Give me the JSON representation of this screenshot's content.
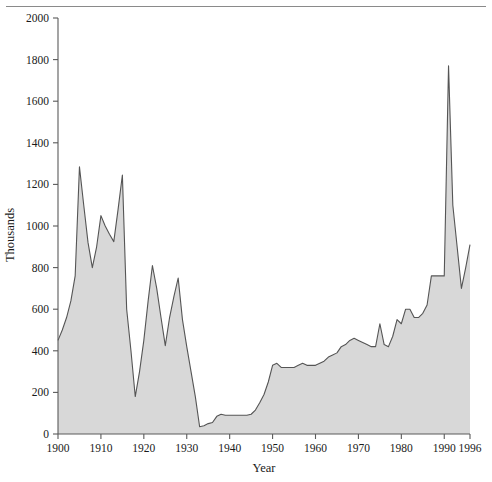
{
  "figure": {
    "background": "#ffffff",
    "has_top_rule": true
  },
  "chart_data": {
    "type": "area",
    "title": "",
    "subtitle": "",
    "xlabel": "Year",
    "ylabel": "Thousands",
    "xlim": [
      1900,
      1996
    ],
    "ylim": [
      0,
      2000
    ],
    "grid": false,
    "legend": null,
    "fill_color": "#d8d8d8",
    "line_color": "#555555",
    "axis_color": "#5a5a5a",
    "x_ticks": [
      1900,
      1910,
      1920,
      1930,
      1940,
      1950,
      1960,
      1970,
      1980,
      1990,
      1996
    ],
    "x_tick_labels": [
      "1900",
      "1910",
      "1920",
      "1930",
      "1940",
      "1950",
      "1960",
      "1970",
      "1980",
      "1990",
      "1996"
    ],
    "y_ticks": [
      0,
      200,
      400,
      600,
      800,
      1000,
      1200,
      1400,
      1600,
      1800,
      2000
    ],
    "y_tick_labels": [
      "0",
      "200",
      "400",
      "600",
      "800",
      "1000",
      "1200",
      "1400",
      "1600",
      "1800",
      "2000"
    ],
    "x": [
      1900,
      1901,
      1902,
      1903,
      1904,
      1905,
      1906,
      1907,
      1908,
      1909,
      1910,
      1911,
      1912,
      1913,
      1914,
      1915,
      1916,
      1917,
      1918,
      1919,
      1920,
      1921,
      1922,
      1923,
      1924,
      1925,
      1926,
      1927,
      1928,
      1929,
      1930,
      1931,
      1932,
      1933,
      1934,
      1935,
      1936,
      1937,
      1938,
      1939,
      1940,
      1941,
      1942,
      1943,
      1944,
      1945,
      1946,
      1947,
      1948,
      1949,
      1950,
      1951,
      1952,
      1953,
      1954,
      1955,
      1956,
      1957,
      1958,
      1959,
      1960,
      1961,
      1962,
      1963,
      1964,
      1965,
      1966,
      1967,
      1968,
      1969,
      1970,
      1971,
      1972,
      1973,
      1974,
      1975,
      1976,
      1977,
      1978,
      1979,
      1980,
      1981,
      1982,
      1983,
      1984,
      1985,
      1986,
      1987,
      1988,
      1989,
      1990,
      1991,
      1992,
      1993,
      1994,
      1995,
      1996
    ],
    "values": [
      450,
      500,
      560,
      640,
      760,
      1285,
      1100,
      920,
      800,
      900,
      1050,
      1000,
      960,
      925,
      1080,
      1245,
      600,
      400,
      180,
      300,
      450,
      640,
      810,
      700,
      560,
      425,
      560,
      660,
      750,
      550,
      420,
      300,
      180,
      35,
      40,
      50,
      55,
      85,
      95,
      90,
      90,
      90,
      90,
      90,
      90,
      95,
      115,
      150,
      190,
      250,
      330,
      340,
      320,
      320,
      320,
      320,
      330,
      340,
      330,
      330,
      330,
      340,
      350,
      370,
      380,
      390,
      420,
      430,
      450,
      460,
      450,
      440,
      430,
      420,
      420,
      530,
      430,
      420,
      470,
      550,
      530,
      600,
      600,
      560,
      560,
      580,
      620,
      760,
      760,
      760,
      760,
      1770,
      1100,
      900,
      700,
      800,
      910
    ]
  },
  "axes": {
    "y_axis_title": "Thousands",
    "x_axis_title": "Year"
  }
}
